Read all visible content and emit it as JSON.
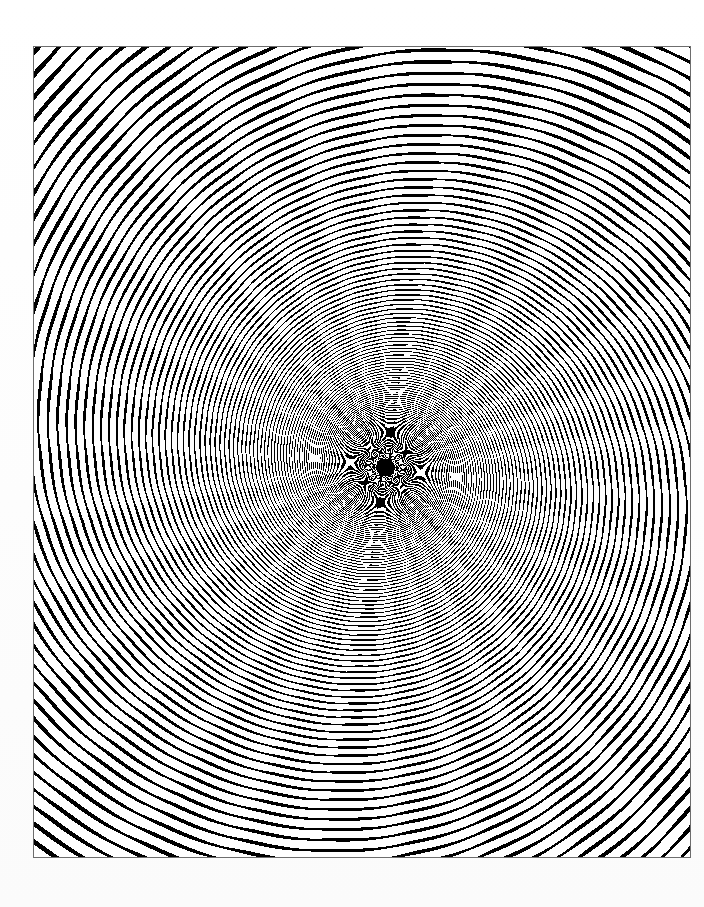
{
  "page": {
    "background_color": "#fefefe",
    "width": 704,
    "height": 907,
    "caption": ""
  },
  "plate": {
    "name": "fractal-spiral-plate",
    "frame_color": "#6d6d6d",
    "frame_width_px": 1,
    "left": 33,
    "top": 46,
    "width": 658,
    "height": 812,
    "ink_color": "#000000",
    "paper_color": "#ffffff",
    "alt_text": "Black and white Mandelbrot set detail: a deep logarithmic spiral of seahorse-tail filaments radiating from a central point."
  },
  "chart_data": {
    "type": "heatmap",
    "title": "",
    "subtitle": "",
    "xlabel": "",
    "ylabel": "",
    "render": "mandelbrot-escape-time-binary",
    "palette": [
      "#ffffff",
      "#000000"
    ],
    "palette_names": [
      "escaped",
      "in-set-or-slow-escape"
    ],
    "binary_threshold_ratio": 0.42,
    "max_iterations": 900,
    "escape_radius": 4.0,
    "supersample": 3,
    "center": {
      "re": -0.743643887037151,
      "im": 0.13182590420533
    },
    "view_half_height": 4.5e-05,
    "rotation_degrees": 0,
    "spiral": {
      "center_px": {
        "x": 385,
        "y": 467
      },
      "arm_count": 30,
      "handedness": "clockwise-outward",
      "growth_per_turn": 2.35,
      "turns_visible": 3.4,
      "inner_dark_core_radius_px": 9
    },
    "axis_ranges": {
      "x": [
        -0.74364392347,
        -0.7436438506
      ],
      "y": [
        0.1318258592,
        0.13182594921
      ]
    },
    "grid": false,
    "legend": false,
    "tick_labels_x": [],
    "tick_labels_y": []
  },
  "accessibility": {
    "figure_role": "image",
    "long_description": "A monochrome fractal plate. Thousands of self-similar black filigree motifs are arranged along roughly thirty logarithmic spiral arms that wind clockwise outward from a dense black point slightly left of and above the plate centre. Motifs are tiny near the core and grow into large seahorse-tail and fan shapes near the plate edges, leaving broad white channels between successive arms."
  }
}
